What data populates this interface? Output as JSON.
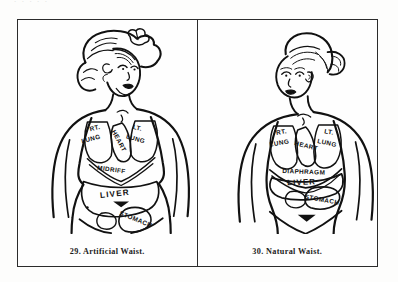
{
  "plate": {
    "top_bleed_text": ". .   .     .      .",
    "frame_color": "#2b2b2b",
    "ink_color": "#111111",
    "paper_color": "#fefefe"
  },
  "panels": [
    {
      "id": "artificial-waist",
      "caption": "29. Artificial Waist.",
      "figure_number": "29",
      "figure_title": "Artificial Waist",
      "hair_style": "high pompadour with ribbon bow",
      "waist_type": "corseted",
      "organ_labels": [
        {
          "id": "rt-lung",
          "text": "RT.",
          "x": 78,
          "y": 108,
          "rotate": -14
        },
        {
          "id": "rt-lung-2",
          "text": "LUNG",
          "x": 74,
          "y": 119,
          "rotate": -14
        },
        {
          "id": "heart",
          "text": "HEART",
          "x": 100,
          "y": 120,
          "rotate": 62
        },
        {
          "id": "lt-lung",
          "text": "LT.",
          "x": 120,
          "y": 108,
          "rotate": 14
        },
        {
          "id": "lt-lung-2",
          "text": "LUNG",
          "x": 118,
          "y": 119,
          "rotate": 16
        },
        {
          "id": "midriff",
          "text": "MIDRIFF",
          "x": 83,
          "y": 146,
          "rotate": 8
        },
        {
          "id": "liver",
          "text": "LIVER",
          "x": 78,
          "y": 172,
          "rotate": -6
        },
        {
          "id": "stomach",
          "text": "STOMACH",
          "x": 102,
          "y": 196,
          "rotate": 22
        }
      ]
    },
    {
      "id": "natural-waist",
      "caption": "30. Natural Waist.",
      "figure_number": "30",
      "figure_title": "Natural Waist",
      "hair_style": "smooth hair gathered in a low bun",
      "waist_type": "natural",
      "organ_labels": [
        {
          "id": "rt-lung",
          "text": "RT.",
          "x": 74,
          "y": 110,
          "rotate": -10
        },
        {
          "id": "rt-lung-2",
          "text": "LUNG",
          "x": 71,
          "y": 121,
          "rotate": -10
        },
        {
          "id": "heart",
          "text": "HEART",
          "x": 96,
          "y": 122,
          "rotate": 14
        },
        {
          "id": "lt-lung",
          "text": "LT.",
          "x": 124,
          "y": 110,
          "rotate": 10
        },
        {
          "id": "lt-lung-2",
          "text": "LUNG",
          "x": 121,
          "y": 121,
          "rotate": 12
        },
        {
          "id": "diaphragm",
          "text": "DIAPHRAGM",
          "x": 72,
          "y": 146,
          "rotate": 2
        },
        {
          "id": "liver",
          "text": "LIVER",
          "x": 78,
          "y": 158,
          "rotate": -2
        },
        {
          "id": "stomach",
          "text": "STOMACH",
          "x": 104,
          "y": 176,
          "rotate": 10
        }
      ]
    }
  ]
}
